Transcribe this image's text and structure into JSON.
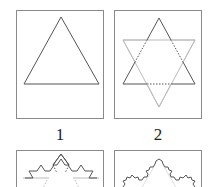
{
  "panels": [
    {
      "id": 1,
      "label": "1",
      "iteration": 0,
      "description": "Equilateral triangle"
    },
    {
      "id": 2,
      "label": "2",
      "iteration": 1,
      "description": "Star of David: triangle with inverted gray triangle overlay, dotted middle thirds"
    },
    {
      "id": 3,
      "label": "",
      "iteration": 2,
      "description": "Second Koch iteration (partially visible)"
    },
    {
      "id": 4,
      "label": "",
      "iteration": 3,
      "description": "Third Koch iteration (partially visible)"
    }
  ],
  "colors": {
    "stroke": "#555555",
    "overlay": "#bbbbbb",
    "border": "#8a8a8a"
  }
}
